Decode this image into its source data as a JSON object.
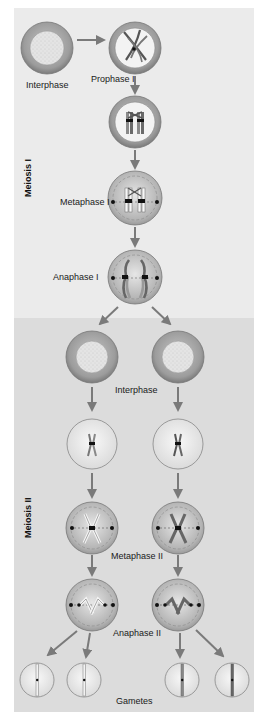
{
  "colors": {
    "page_bg": "#ffffff",
    "meiosis1_bg": "#ebebeb",
    "meiosis2_bg": "#dcdcdc",
    "arrow": "#7a7a7a",
    "cell_ring": "#9a9a9a",
    "cell_ring_dark": "#6e6e6e",
    "nucleus": "#e2e2e2",
    "cell_light": "#f4f4f4",
    "chromosome": "#666666",
    "centromere": "#111111"
  },
  "sections": {
    "meiosis1": {
      "label": "Meiosis I"
    },
    "meiosis2": {
      "label": "Meiosis II"
    }
  },
  "stages": {
    "interphase1": "Interphase",
    "prophase1": "Prophase I",
    "metaphase1": "Metaphase I",
    "anaphase1": "Anaphase I",
    "interphase2": "Interphase",
    "metaphase2": "Metaphase II",
    "anaphase2": "Anaphase II",
    "gametes": "Gametes"
  }
}
